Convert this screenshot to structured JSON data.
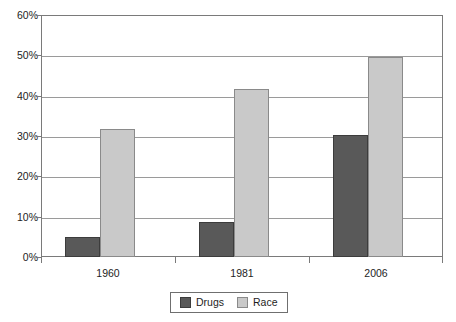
{
  "chart_data": {
    "type": "bar",
    "title": "",
    "subtitle": "",
    "xlabel": "",
    "ylabel": "",
    "categories": [
      "1960",
      "1981",
      "2006"
    ],
    "series": [
      {
        "name": "Drugs",
        "color": "#595959",
        "values": [
          5.0,
          8.7,
          30.3
        ]
      },
      {
        "name": "Race",
        "color": "#c9c9c9",
        "values": [
          31.8,
          41.7,
          49.6
        ]
      }
    ],
    "ylim": [
      0,
      60
    ],
    "ytick_values": [
      0,
      10,
      20,
      30,
      40,
      50,
      60
    ],
    "ytick_labels": [
      "0%",
      "10%",
      "20%",
      "30%",
      "40%",
      "50%",
      "60%"
    ],
    "value_suffix": "%",
    "grid": true,
    "grid_axis": "y",
    "legend_position": "bottom",
    "legend_entries": [
      "Drugs",
      "Race"
    ]
  }
}
